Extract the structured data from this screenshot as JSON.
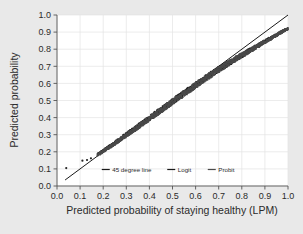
{
  "chart_data": {
    "type": "scatter",
    "title": "",
    "subtitle": "",
    "xlabel": "Predicted probability of staying healthy (LPM)",
    "ylabel": "Predicted probability",
    "xlim": [
      0.0,
      1.0
    ],
    "ylim": [
      0.0,
      1.0
    ],
    "xticks": [
      "0.0",
      "0.1",
      "0.2",
      "0.3",
      "0.4",
      "0.5",
      "0.6",
      "0.7",
      "0.8",
      "0.9",
      "1.0"
    ],
    "yticks": [
      "0.0",
      "0.1",
      "0.2",
      "0.3",
      "0.4",
      "0.5",
      "0.6",
      "0.7",
      "0.8",
      "0.9",
      "1.0"
    ],
    "xtick_values": [
      0.0,
      0.1,
      0.2,
      0.3,
      0.4,
      0.5,
      0.6,
      0.7,
      0.8,
      0.9,
      1.0
    ],
    "ytick_values": [
      0.0,
      0.1,
      0.2,
      0.3,
      0.4,
      0.5,
      0.6,
      0.7,
      0.8,
      0.9,
      1.0
    ],
    "grid": true,
    "grid_color": "#e4e4e4",
    "plot_bgcolor": "#ffffff",
    "figure_bgcolor": "#e9e9e9",
    "legend_position": "inside-bottom-center",
    "legend": [
      {
        "name": "45 degree line",
        "marker": "line",
        "color": "#1a1a1a"
      },
      {
        "name": "Logit",
        "marker": "line",
        "color": "#1a1a1a"
      },
      {
        "name": "Probit",
        "marker": "line",
        "color": "#4a4a4a"
      }
    ],
    "series": [
      {
        "name": "45 degree line",
        "type": "line",
        "color": "#1a1a1a",
        "x": [
          0.035,
          1.0
        ],
        "y": [
          0.035,
          1.0
        ]
      },
      {
        "name": "Logit",
        "type": "scatter",
        "color": "#232323",
        "x": [
          0.04,
          0.11,
          0.13,
          0.15,
          0.175,
          0.19,
          0.205,
          0.22,
          0.235,
          0.25,
          0.265,
          0.28,
          0.295,
          0.31,
          0.325,
          0.34,
          0.355,
          0.37,
          0.385,
          0.4,
          0.415,
          0.43,
          0.445,
          0.46,
          0.475,
          0.49,
          0.505,
          0.52,
          0.535,
          0.55,
          0.565,
          0.58,
          0.595,
          0.61,
          0.625,
          0.64,
          0.655,
          0.67,
          0.685,
          0.7,
          0.715,
          0.73,
          0.745,
          0.76,
          0.775,
          0.79,
          0.805,
          0.82,
          0.835,
          0.85,
          0.865,
          0.88,
          0.895,
          0.91,
          0.925,
          0.94,
          0.955,
          0.97,
          0.985,
          1.0
        ],
        "y": [
          0.105,
          0.148,
          0.155,
          0.168,
          0.185,
          0.197,
          0.21,
          0.224,
          0.238,
          0.252,
          0.266,
          0.281,
          0.295,
          0.31,
          0.324,
          0.339,
          0.353,
          0.368,
          0.382,
          0.397,
          0.412,
          0.426,
          0.441,
          0.455,
          0.47,
          0.484,
          0.499,
          0.513,
          0.528,
          0.542,
          0.556,
          0.57,
          0.585,
          0.6,
          0.615,
          0.629,
          0.643,
          0.656,
          0.669,
          0.682,
          0.695,
          0.708,
          0.72,
          0.733,
          0.745,
          0.757,
          0.769,
          0.781,
          0.793,
          0.805,
          0.817,
          0.829,
          0.841,
          0.853,
          0.864,
          0.876,
          0.888,
          0.9,
          0.911,
          0.921
        ]
      },
      {
        "name": "Probit",
        "type": "scatter",
        "color": "#4a4a4a",
        "x": [
          0.04,
          0.11,
          0.13,
          0.15,
          0.175,
          0.19,
          0.205,
          0.22,
          0.235,
          0.25,
          0.265,
          0.28,
          0.295,
          0.31,
          0.325,
          0.34,
          0.355,
          0.37,
          0.385,
          0.4,
          0.415,
          0.43,
          0.445,
          0.46,
          0.475,
          0.49,
          0.505,
          0.52,
          0.535,
          0.55,
          0.565,
          0.58,
          0.595,
          0.61,
          0.625,
          0.64,
          0.655,
          0.67,
          0.685,
          0.7,
          0.715,
          0.73,
          0.745,
          0.76,
          0.775,
          0.79,
          0.805,
          0.82,
          0.835,
          0.85,
          0.865,
          0.88,
          0.895,
          0.91,
          0.925,
          0.94,
          0.955,
          0.97,
          0.985,
          1.0
        ],
        "y": [
          0.102,
          0.144,
          0.152,
          0.165,
          0.182,
          0.194,
          0.208,
          0.221,
          0.235,
          0.249,
          0.263,
          0.278,
          0.292,
          0.307,
          0.321,
          0.336,
          0.35,
          0.365,
          0.38,
          0.394,
          0.409,
          0.424,
          0.438,
          0.453,
          0.467,
          0.482,
          0.496,
          0.511,
          0.525,
          0.54,
          0.554,
          0.568,
          0.583,
          0.598,
          0.612,
          0.626,
          0.64,
          0.654,
          0.667,
          0.68,
          0.693,
          0.706,
          0.719,
          0.731,
          0.744,
          0.756,
          0.768,
          0.78,
          0.792,
          0.804,
          0.816,
          0.828,
          0.84,
          0.852,
          0.863,
          0.875,
          0.887,
          0.899,
          0.91,
          0.92
        ]
      }
    ],
    "outliers": [
      {
        "x": 0.04,
        "y": 0.105
      },
      {
        "x": 0.11,
        "y": 0.148
      },
      {
        "x": 0.13,
        "y": 0.152
      },
      {
        "x": 0.147,
        "y": 0.162
      }
    ]
  }
}
